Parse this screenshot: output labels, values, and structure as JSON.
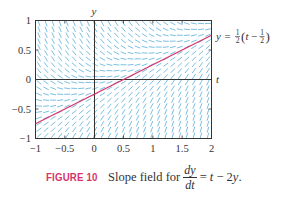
{
  "chart_data": {
    "type": "slope_field",
    "equation": "dy/dt = t - 2y",
    "xlabel": "t",
    "ylabel": "y",
    "xlim": [
      -1,
      2
    ],
    "ylim": [
      -1,
      1
    ],
    "xticks": [
      -1,
      -0.5,
      0,
      0.5,
      1,
      1.5,
      2
    ],
    "xtick_labels": [
      "−1",
      "−0.5",
      "0",
      "0.5",
      "1",
      "1.5",
      "2"
    ],
    "yticks": [
      -1,
      -0.5,
      0,
      0.5,
      1
    ],
    "ytick_labels": [
      "−1",
      "−0.5",
      "0",
      "0.5",
      "1"
    ],
    "grid": false,
    "field_color": "#5aaed8",
    "series": [
      {
        "name": "y = 1/2 (t − 1/2)",
        "type": "line",
        "color": "#d6336c",
        "x": [
          -1,
          2
        ],
        "y": [
          -0.75,
          0.75
        ]
      }
    ],
    "annotations": [
      {
        "text": "y = ½(t − ½)",
        "x": 2,
        "y": 0.75
      }
    ]
  },
  "figure": {
    "y_axis_label": "y",
    "t_axis_label": "t",
    "curve_label": {
      "lhs": "y =",
      "half": "1",
      "half_den": "2",
      "t": "t",
      "minus": "−",
      "inner_num": "1",
      "inner_den": "2"
    },
    "x_ticks": [
      "−1",
      "−0.5",
      "0",
      "0.5",
      "1",
      "1.5",
      "2"
    ],
    "y_ticks": [
      "1",
      "0.5",
      "0",
      "−0.5",
      "−1"
    ]
  },
  "caption": {
    "label": "FIGURE 10",
    "text": "Slope field for",
    "frac_num": "dy",
    "frac_den": "dt",
    "rhs_eq": "=",
    "rhs_t": "t",
    "rhs_minus": " − 2",
    "rhs_y": "y",
    "rhs_end": "."
  },
  "colors": {
    "field": "#5aaed8",
    "curve": "#d6336c",
    "axes": "#333333",
    "frame": "#333333",
    "label": "#d6336c"
  }
}
